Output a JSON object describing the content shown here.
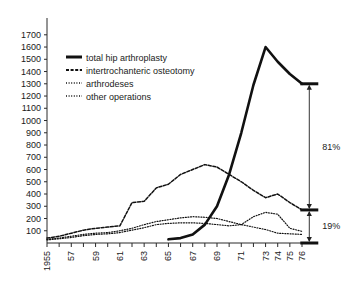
{
  "chart_data": {
    "type": "line",
    "title": "",
    "subtitle": "",
    "xlabel": "",
    "ylabel": "",
    "x": [
      1955,
      1956,
      1957,
      1958,
      1959,
      1960,
      1961,
      1962,
      1963,
      1964,
      1965,
      1966,
      1967,
      1968,
      1969,
      1970,
      1971,
      1972,
      1973,
      1974,
      1975,
      1976
    ],
    "xtick_labels": [
      "1955",
      "57",
      "59",
      "61",
      "63",
      "65",
      "67",
      "69",
      "71",
      "73",
      "74",
      "75",
      "76"
    ],
    "xtick_values": [
      1955,
      1957,
      1959,
      1961,
      1963,
      1965,
      1967,
      1969,
      1971,
      1973,
      1974,
      1975,
      1976
    ],
    "ytick_labels": [
      "100",
      "200",
      "300",
      "400",
      "500",
      "600",
      "700",
      "800",
      "900",
      "1000",
      "1100",
      "1200",
      "1300",
      "1400",
      "1500",
      "1600",
      "1700"
    ],
    "ytick_values": [
      100,
      200,
      300,
      400,
      500,
      600,
      700,
      800,
      900,
      1000,
      1100,
      1200,
      1300,
      1400,
      1500,
      1600,
      1700
    ],
    "ylim": [
      0,
      1780
    ],
    "xlim": [
      1955,
      1976
    ],
    "grid": false,
    "legend_position": "top-left",
    "series": [
      {
        "name": "total hip arthroplasty",
        "style": "solid",
        "color": "#111111",
        "x": [
          1965,
          1966,
          1967,
          1968,
          1969,
          1970,
          1971,
          1972,
          1973,
          1974,
          1975,
          1976
        ],
        "values": [
          30,
          40,
          70,
          150,
          300,
          560,
          900,
          1290,
          1600,
          1480,
          1380,
          1300
        ]
      },
      {
        "name": "intertrochanteric osteotomy",
        "style": "dashed",
        "color": "#111111",
        "x": [
          1955,
          1956,
          1957,
          1958,
          1959,
          1960,
          1961,
          1962,
          1963,
          1964,
          1965,
          1966,
          1967,
          1968,
          1969,
          1970,
          1971,
          1972,
          1973,
          1974,
          1975,
          1976
        ],
        "values": [
          40,
          55,
          80,
          105,
          120,
          130,
          140,
          330,
          340,
          450,
          480,
          560,
          600,
          640,
          620,
          560,
          500,
          430,
          370,
          400,
          330,
          270
        ]
      },
      {
        "name": "arthrodeses",
        "style": "dotted",
        "color": "#555555",
        "x": [
          1955,
          1956,
          1957,
          1958,
          1959,
          1960,
          1961,
          1962,
          1963,
          1964,
          1965,
          1966,
          1967,
          1968,
          1969,
          1970,
          1971,
          1972,
          1973,
          1974,
          1975,
          1976
        ],
        "values": [
          30,
          40,
          55,
          70,
          80,
          85,
          100,
          120,
          150,
          175,
          190,
          205,
          215,
          210,
          200,
          175,
          150,
          130,
          110,
          80,
          75,
          70
        ]
      },
      {
        "name": "other operations",
        "style": "dotted",
        "color": "#777777",
        "x": [
          1955,
          1956,
          1957,
          1958,
          1959,
          1960,
          1961,
          1962,
          1963,
          1964,
          1965,
          1966,
          1967,
          1968,
          1969,
          1970,
          1971,
          1972,
          1973,
          1974,
          1975,
          1976
        ],
        "values": [
          25,
          35,
          45,
          60,
          70,
          75,
          85,
          105,
          125,
          150,
          160,
          165,
          165,
          160,
          150,
          140,
          150,
          215,
          250,
          235,
          120,
          95
        ]
      }
    ],
    "annotations": [
      {
        "label": "81%",
        "from": 270,
        "to": 1300,
        "at_x": 1976.6
      },
      {
        "label": "19%",
        "from": 0,
        "to": 270,
        "at_x": 1976.6
      }
    ]
  },
  "legend": {
    "items": [
      {
        "label": "total hip arthroplasty",
        "style": "solid"
      },
      {
        "label": "intertrochanteric osteotomy",
        "style": "dashed"
      },
      {
        "label": "arthrodeses",
        "style": "dotted"
      },
      {
        "label": "other operations",
        "style": "dotted"
      }
    ]
  }
}
